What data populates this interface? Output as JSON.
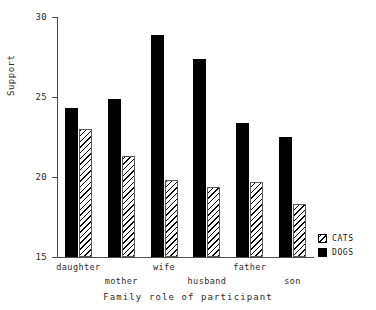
{
  "chart_data": {
    "type": "bar",
    "title": "",
    "xlabel": "Family role of participant",
    "ylabel": "Support",
    "categories": [
      "daughter",
      "mother",
      "wife",
      "husband",
      "father",
      "son"
    ],
    "series": [
      {
        "name": "DOGS",
        "values": [
          24.3,
          24.9,
          28.9,
          27.4,
          23.4,
          22.5
        ]
      },
      {
        "name": "CATS",
        "values": [
          23.0,
          21.3,
          19.8,
          19.4,
          19.7,
          18.3
        ]
      }
    ],
    "ylim": [
      15,
      30
    ],
    "yticks": [
      15,
      20,
      25,
      30
    ],
    "ytick_labels": [
      "15",
      "20",
      "25",
      "30"
    ],
    "grid": false,
    "legend_position": "right-bottom",
    "legend": [
      {
        "label": "CATS",
        "swatch": "hatched-diagonal"
      },
      {
        "label": "DOGS",
        "swatch": "solid-black"
      }
    ],
    "colors": {
      "dogs": "#000000",
      "cats_outline": "#5a5a5a",
      "axis": "#4d4d4d",
      "background": "#ffffff"
    }
  }
}
